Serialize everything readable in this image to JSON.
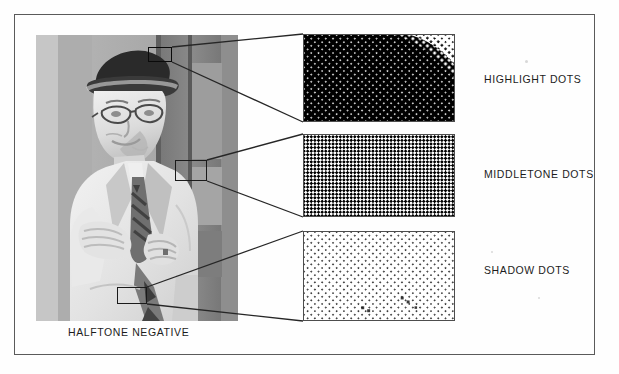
{
  "figure": {
    "kind": "halftone-illustration",
    "border_color": "#5a5a5a",
    "background_color": "#ffffff"
  },
  "photo": {
    "caption": "HALFTONE NEGATIVE",
    "description": "photographic negative of a man wearing a hat and light suit with tie",
    "tone": "negative"
  },
  "callouts": [
    {
      "id": "highlight",
      "rect_label": "highlight-region",
      "patch_label": "HIGHLIGHT DOTS",
      "pattern": "dense-dark-dots-with-light-corner-gradient",
      "dot_coverage_percent": 90,
      "ink_color": "#000000",
      "paper_color": "#ffffff"
    },
    {
      "id": "middletone",
      "rect_label": "middletone-region",
      "patch_label": "MIDDLETONE  DOTS",
      "pattern": "fifty-percent-checkerboard",
      "dot_coverage_percent": 50,
      "ink_color": "#000000",
      "paper_color": "#ffffff"
    },
    {
      "id": "shadow",
      "rect_label": "shadow-region",
      "patch_label": "SHADOW DOTS",
      "pattern": "sparse-small-dark-dots",
      "dot_coverage_percent": 12,
      "ink_color": "#111111",
      "paper_color": "#ffffff"
    }
  ]
}
